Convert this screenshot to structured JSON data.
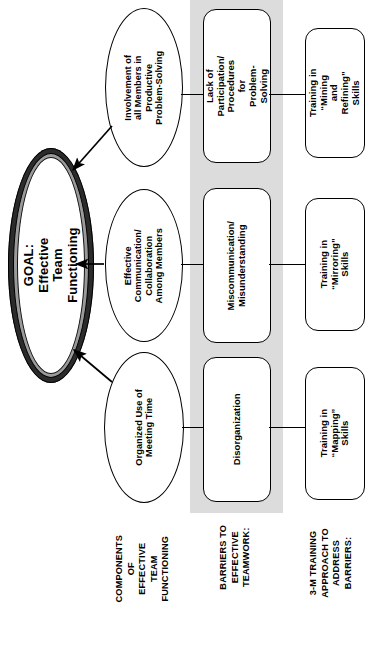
{
  "diagram": {
    "orientation": "rotated-90-ccw",
    "colors": {
      "band": "#dcdcdc",
      "goal_ring_outer": "#2b2b2b",
      "goal_ring_inner": "#9a9a9a",
      "stroke": "#000000",
      "background": "#ffffff"
    }
  },
  "goal": {
    "line1": "GOAL:",
    "line2": "Effective Team Functioning",
    "text": "GOAL:\nEffective Team Functioning"
  },
  "components": [
    {
      "id": "involvement",
      "text": "Involvement of\nall Members in\nProductive\nProblem-Solving"
    },
    {
      "id": "communication",
      "text": "Effective\nCommunication/\nCollaboration\nAmong Members"
    },
    {
      "id": "meeting-time",
      "text": "Organized Use of\nMeeting Time"
    }
  ],
  "barriers": [
    {
      "id": "lack-participation",
      "text": "Lack of Participation/\nProcedures for\nProblem-Solving"
    },
    {
      "id": "miscommunication",
      "text": "Miscommunication/\nMisunderstanding"
    },
    {
      "id": "disorganization",
      "text": "Disorganization"
    }
  ],
  "trainings": [
    {
      "id": "mining-refining",
      "text": "Training in “Mining\nand Refining” Skills"
    },
    {
      "id": "mirroring",
      "text": "Training in\n“Mirroring” Skills"
    },
    {
      "id": "mapping",
      "text": "Training in\n“Mapping” Skills"
    }
  ],
  "captions": [
    {
      "id": "components",
      "text": "COMPONENTS OF\nEFFECTIVE TEAM\nFUNCTIONING"
    },
    {
      "id": "barriers",
      "text": "BARRIERS TO\nEFFECTIVE\nTEAMWORK:"
    },
    {
      "id": "training",
      "text": "3-M TRAINING\nAPPROACH TO\nADDRESS BARRIERS:"
    }
  ]
}
